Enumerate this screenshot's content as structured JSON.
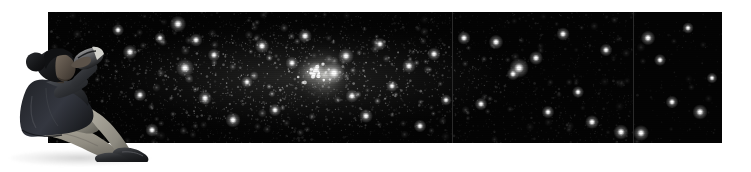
{
  "scene": {
    "title": "Stargazer watching the night sky",
    "description": "A person seated on the ground, holding binoculars to their eyes, silhouetted against a wide panoramic photograph of a dense star field containing a bright nebula and star cluster.",
    "background_color": "#ffffff",
    "canvas": {
      "width": 751,
      "height": 172
    }
  },
  "starfield": {
    "name": "star-field-panorama",
    "alt_text": "Panoramic astronomical photograph of a dense Milky Way star field with a bright nebula",
    "frame": {
      "x": 48,
      "y": 12,
      "width": 674,
      "height": 131
    },
    "sky_color": "#040404",
    "star_color": "#ffffff",
    "seam_color": "#2a2a2a",
    "seams_x": [
      452,
      633
    ],
    "panels": [
      {
        "name": "panel-left",
        "x": 48,
        "width": 404,
        "density": 1.0,
        "brightness": 1.0
      },
      {
        "name": "panel-middle",
        "x": 452,
        "width": 181,
        "density": 0.85,
        "brightness": 0.92
      },
      {
        "name": "panel-right",
        "x": 633,
        "width": 89,
        "density": 0.34,
        "brightness": 0.78
      }
    ],
    "nebula": {
      "name": "bright-nebula-cluster",
      "label": "Bright nebula with embedded star cluster",
      "cx": 324,
      "cy": 75,
      "radius": 34,
      "core_color": "#f2f2ef",
      "halo_color": "#8f8f8c"
    },
    "milky_way_band": {
      "name": "milky-way-glow-band",
      "cx": 300,
      "cy": 78,
      "rx": 240,
      "ry": 62,
      "color": "#3a3a38"
    },
    "bright_stars": [
      {
        "x": 178,
        "y": 24,
        "r": 2.6
      },
      {
        "x": 196,
        "y": 40,
        "r": 2.1
      },
      {
        "x": 160,
        "y": 38,
        "r": 1.8
      },
      {
        "x": 185,
        "y": 68,
        "r": 2.9
      },
      {
        "x": 214,
        "y": 55,
        "r": 2.0
      },
      {
        "x": 205,
        "y": 98,
        "r": 2.2
      },
      {
        "x": 233,
        "y": 120,
        "r": 2.4
      },
      {
        "x": 247,
        "y": 82,
        "r": 1.9
      },
      {
        "x": 262,
        "y": 46,
        "r": 2.3
      },
      {
        "x": 275,
        "y": 110,
        "r": 2.0
      },
      {
        "x": 292,
        "y": 63,
        "r": 2.1
      },
      {
        "x": 305,
        "y": 36,
        "r": 2.2
      },
      {
        "x": 316,
        "y": 70,
        "r": 2.6
      },
      {
        "x": 334,
        "y": 73,
        "r": 3.4
      },
      {
        "x": 346,
        "y": 56,
        "r": 2.5
      },
      {
        "x": 352,
        "y": 96,
        "r": 2.1
      },
      {
        "x": 366,
        "y": 116,
        "r": 2.2
      },
      {
        "x": 380,
        "y": 44,
        "r": 2.0
      },
      {
        "x": 392,
        "y": 86,
        "r": 1.9
      },
      {
        "x": 409,
        "y": 66,
        "r": 2.2
      },
      {
        "x": 420,
        "y": 126,
        "r": 2.0
      },
      {
        "x": 434,
        "y": 54,
        "r": 2.1
      },
      {
        "x": 446,
        "y": 100,
        "r": 1.8
      },
      {
        "x": 464,
        "y": 38,
        "r": 2.1
      },
      {
        "x": 481,
        "y": 104,
        "r": 2.0
      },
      {
        "x": 496,
        "y": 42,
        "r": 2.3
      },
      {
        "x": 513,
        "y": 74,
        "r": 2.0
      },
      {
        "x": 519,
        "y": 68,
        "r": 3.1
      },
      {
        "x": 536,
        "y": 58,
        "r": 2.2
      },
      {
        "x": 548,
        "y": 112,
        "r": 2.0
      },
      {
        "x": 563,
        "y": 34,
        "r": 2.1
      },
      {
        "x": 578,
        "y": 92,
        "r": 1.9
      },
      {
        "x": 592,
        "y": 122,
        "r": 2.2
      },
      {
        "x": 606,
        "y": 50,
        "r": 2.0
      },
      {
        "x": 621,
        "y": 132,
        "r": 2.4
      },
      {
        "x": 648,
        "y": 38,
        "r": 2.3
      },
      {
        "x": 660,
        "y": 60,
        "r": 1.9
      },
      {
        "x": 672,
        "y": 102,
        "r": 2.0
      },
      {
        "x": 700,
        "y": 112,
        "r": 2.4
      },
      {
        "x": 641,
        "y": 133,
        "r": 2.5
      },
      {
        "x": 688,
        "y": 28,
        "r": 1.8
      },
      {
        "x": 712,
        "y": 78,
        "r": 1.7
      },
      {
        "x": 130,
        "y": 52,
        "r": 2.3
      },
      {
        "x": 140,
        "y": 95,
        "r": 2.0
      },
      {
        "x": 118,
        "y": 30,
        "r": 1.9
      },
      {
        "x": 152,
        "y": 130,
        "r": 2.1
      }
    ]
  },
  "observer": {
    "name": "seated-stargazer-figure",
    "alt_text": "Person sitting on the ground looking through binoculars",
    "frame": {
      "x": 6,
      "y": 36,
      "width": 148,
      "height": 126
    },
    "colors": {
      "hair": "#17181a",
      "skin": "#4e463f",
      "skin_lit": "#6d645a",
      "jacket": "#2f3135",
      "jacket_shadow": "#1d1f22",
      "jacket_highlight": "#4a4d52",
      "trousers": "#9a968b",
      "trousers_shadow": "#6f6c63",
      "shoes": "#242528",
      "shoe_highlight": "#45474b",
      "binoculars": "#1a1b1e",
      "binoculars_highlight": "#c9c9c4"
    },
    "parts": [
      {
        "name": "hair-bun",
        "label": "Hair tied in a bun"
      },
      {
        "name": "head",
        "label": "Head tilted upward"
      },
      {
        "name": "binoculars",
        "label": "Binoculars raised to the eyes"
      },
      {
        "name": "arms",
        "label": "Both arms raised holding the binoculars"
      },
      {
        "name": "jacket",
        "label": "Dark hooded jacket / coat"
      },
      {
        "name": "legs",
        "label": "Light khaki trousers, knees bent"
      },
      {
        "name": "shoes",
        "label": "Dark hiking shoes"
      }
    ]
  },
  "ground_shadow": {
    "name": "figure-ground-shadow",
    "x": 10,
    "y": 150,
    "width": 140,
    "height": 16
  }
}
